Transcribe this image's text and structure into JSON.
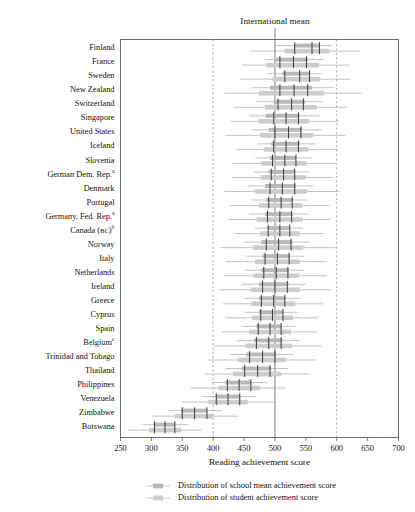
{
  "chart_data": {
    "type": "bar",
    "title": "",
    "top_annotation": "International mean",
    "xlabel": "Reading achievement score",
    "ylabel": "",
    "xlim": [
      250,
      700
    ],
    "xticks": [
      250,
      300,
      350,
      400,
      450,
      500,
      550,
      600,
      650,
      700
    ],
    "grid": false,
    "reference_lines": [
      {
        "value": 400,
        "style": "dashed"
      },
      {
        "value": 500,
        "style": "solid",
        "label": "International mean"
      },
      {
        "value": 600,
        "style": "dashed"
      }
    ],
    "legend_position": "bottom",
    "series": [
      {
        "name": "Distribution of school mean achievement score",
        "color": "#b9b9b9"
      },
      {
        "name": "Distribution of student achievement score",
        "color": "#cdcdcd"
      }
    ],
    "categories": [
      "Finland",
      "France",
      "Sweden",
      "New Zealand",
      "Switzerland",
      "Singapore",
      "United States",
      "Iceland",
      "Slovenia",
      "German Dem. Rep.",
      "Denmark",
      "Portugal",
      "Germany, Fed. Rep.",
      "Canada (BC)",
      "Norway",
      "Italy",
      "Netherlands",
      "Ireland",
      "Greece",
      "Cyprus",
      "Spain",
      "Belgium",
      "Trinidad and Tobago",
      "Thailand",
      "Philippines",
      "Venezuela",
      "Zimbabwe",
      "Botswana"
    ],
    "category_footnotes": {
      "German Dem. Rep.": "a",
      "Germany, Fed. Rep.": "a",
      "Canada (BC)": "b",
      "Belgium": "c"
    },
    "rows": [
      {
        "country": "Finland",
        "school": {
          "lo": 500,
          "q1": 532,
          "med": 560,
          "q3": 572,
          "hi": 592
        },
        "student": {
          "lo": 460,
          "q1": 516,
          "med": 560,
          "q3": 588,
          "hi": 638
        },
        "ticks": [
          532,
          560,
          572
        ]
      },
      {
        "country": "France",
        "school": {
          "lo": 483,
          "q1": 500,
          "med": 530,
          "q3": 553,
          "hi": 580
        },
        "student": {
          "lo": 447,
          "q1": 486,
          "med": 530,
          "q3": 571,
          "hi": 620
        },
        "ticks": [
          508,
          530,
          551
        ]
      },
      {
        "country": "Sweden",
        "school": {
          "lo": 488,
          "q1": 512,
          "med": 543,
          "q3": 556,
          "hi": 576
        },
        "student": {
          "lo": 443,
          "q1": 496,
          "med": 543,
          "q3": 573,
          "hi": 622
        },
        "ticks": [
          516,
          540,
          556
        ]
      },
      {
        "country": "New Zealand",
        "school": {
          "lo": 462,
          "q1": 492,
          "med": 531,
          "q3": 560,
          "hi": 596
        },
        "student": {
          "lo": 418,
          "q1": 474,
          "med": 531,
          "q3": 580,
          "hi": 640
        },
        "ticks": [
          508,
          531,
          553
        ]
      },
      {
        "country": "Switzerland",
        "school": {
          "lo": 470,
          "q1": 498,
          "med": 527,
          "q3": 549,
          "hi": 578
        },
        "student": {
          "lo": 434,
          "q1": 484,
          "med": 527,
          "q3": 568,
          "hi": 616
        },
        "ticks": [
          505,
          527,
          546
        ]
      },
      {
        "country": "Singapore",
        "school": {
          "lo": 458,
          "q1": 485,
          "med": 518,
          "q3": 540,
          "hi": 572
        },
        "student": {
          "lo": 428,
          "q1": 474,
          "med": 518,
          "q3": 555,
          "hi": 604
        },
        "ticks": [
          498,
          518,
          538
        ]
      },
      {
        "country": "United States",
        "school": {
          "lo": 462,
          "q1": 490,
          "med": 522,
          "q3": 544,
          "hi": 576
        },
        "student": {
          "lo": 420,
          "q1": 476,
          "med": 522,
          "q3": 562,
          "hi": 614
        },
        "ticks": [
          500,
          522,
          542
        ]
      },
      {
        "country": "Iceland",
        "school": {
          "lo": 472,
          "q1": 494,
          "med": 518,
          "q3": 540,
          "hi": 566
        },
        "student": {
          "lo": 438,
          "q1": 482,
          "med": 518,
          "q3": 554,
          "hi": 602
        },
        "ticks": [
          498,
          518,
          538
        ]
      },
      {
        "country": "Slovenia",
        "school": {
          "lo": 468,
          "q1": 492,
          "med": 516,
          "q3": 534,
          "hi": 560
        },
        "student": {
          "lo": 432,
          "q1": 478,
          "med": 516,
          "q3": 552,
          "hi": 598
        },
        "ticks": [
          496,
          516,
          534
        ]
      },
      {
        "country": "German Dem. Rep.",
        "school": {
          "lo": 466,
          "q1": 490,
          "med": 514,
          "q3": 532,
          "hi": 556
        },
        "student": {
          "lo": 430,
          "q1": 477,
          "med": 514,
          "q3": 550,
          "hi": 594
        },
        "ticks": [
          494,
          514,
          532
        ]
      },
      {
        "country": "Denmark",
        "school": {
          "lo": 456,
          "q1": 484,
          "med": 512,
          "q3": 534,
          "hi": 562
        },
        "student": {
          "lo": 418,
          "q1": 468,
          "med": 512,
          "q3": 552,
          "hi": 604
        },
        "ticks": [
          492,
          512,
          532
        ]
      },
      {
        "country": "Portugal",
        "school": {
          "lo": 462,
          "q1": 486,
          "med": 510,
          "q3": 528,
          "hi": 552
        },
        "student": {
          "lo": 428,
          "q1": 474,
          "med": 510,
          "q3": 544,
          "hi": 588
        },
        "ticks": [
          490,
          510,
          528
        ]
      },
      {
        "country": "Germany, Fed. Rep.",
        "school": {
          "lo": 458,
          "q1": 484,
          "med": 508,
          "q3": 528,
          "hi": 554
        },
        "student": {
          "lo": 424,
          "q1": 470,
          "med": 508,
          "q3": 545,
          "hi": 590
        },
        "ticks": [
          488,
          508,
          527
        ]
      },
      {
        "country": "Canada (BC)",
        "school": {
          "lo": 468,
          "q1": 488,
          "med": 508,
          "q3": 524,
          "hi": 546
        },
        "student": {
          "lo": 434,
          "q1": 476,
          "med": 508,
          "q3": 540,
          "hi": 580
        },
        "ticks": [
          489,
          508,
          524
        ]
      },
      {
        "country": "Norway",
        "school": {
          "lo": 450,
          "q1": 478,
          "med": 506,
          "q3": 528,
          "hi": 556
        },
        "student": {
          "lo": 412,
          "q1": 464,
          "med": 506,
          "q3": 546,
          "hi": 598
        },
        "ticks": [
          486,
          506,
          526
        ]
      },
      {
        "country": "Italy",
        "school": {
          "lo": 454,
          "q1": 480,
          "med": 504,
          "q3": 524,
          "hi": 548
        },
        "student": {
          "lo": 420,
          "q1": 468,
          "med": 504,
          "q3": 540,
          "hi": 584
        },
        "ticks": [
          484,
          504,
          523
        ]
      },
      {
        "country": "Netherlands",
        "school": {
          "lo": 452,
          "q1": 478,
          "med": 502,
          "q3": 522,
          "hi": 548
        },
        "student": {
          "lo": 418,
          "q1": 465,
          "med": 502,
          "q3": 539,
          "hi": 584
        },
        "ticks": [
          482,
          502,
          521
        ]
      },
      {
        "country": "Ireland",
        "school": {
          "lo": 446,
          "q1": 474,
          "med": 500,
          "q3": 522,
          "hi": 550
        },
        "student": {
          "lo": 410,
          "q1": 460,
          "med": 500,
          "q3": 540,
          "hi": 590
        },
        "ticks": [
          480,
          500,
          520
        ]
      },
      {
        "country": "Greece",
        "school": {
          "lo": 450,
          "q1": 474,
          "med": 498,
          "q3": 517,
          "hi": 542
        },
        "student": {
          "lo": 416,
          "q1": 462,
          "med": 498,
          "q3": 533,
          "hi": 578
        },
        "ticks": [
          478,
          498,
          516
        ]
      },
      {
        "country": "Cyprus",
        "school": {
          "lo": 452,
          "q1": 474,
          "med": 496,
          "q3": 513,
          "hi": 536
        },
        "student": {
          "lo": 420,
          "q1": 463,
          "med": 496,
          "q3": 529,
          "hi": 570
        },
        "ticks": [
          477,
          496,
          513
        ]
      },
      {
        "country": "Spain",
        "school": {
          "lo": 448,
          "q1": 470,
          "med": 492,
          "q3": 510,
          "hi": 534
        },
        "student": {
          "lo": 414,
          "q1": 458,
          "med": 492,
          "q3": 526,
          "hi": 568
        },
        "ticks": [
          473,
          492,
          510
        ]
      },
      {
        "country": "Belgium",
        "school": {
          "lo": 438,
          "q1": 466,
          "med": 490,
          "q3": 512,
          "hi": 540
        },
        "student": {
          "lo": 402,
          "q1": 452,
          "med": 490,
          "q3": 528,
          "hi": 576
        },
        "ticks": [
          470,
          490,
          510
        ]
      },
      {
        "country": "Trinidad and Tobago",
        "school": {
          "lo": 428,
          "q1": 454,
          "med": 480,
          "q3": 502,
          "hi": 530
        },
        "student": {
          "lo": 392,
          "q1": 440,
          "med": 480,
          "q3": 518,
          "hi": 566
        },
        "ticks": [
          459,
          480,
          500
        ]
      },
      {
        "country": "Thailand",
        "school": {
          "lo": 420,
          "q1": 446,
          "med": 472,
          "q3": 494,
          "hi": 522
        },
        "student": {
          "lo": 386,
          "q1": 432,
          "med": 472,
          "q3": 510,
          "hi": 556
        },
        "ticks": [
          451,
          472,
          492
        ]
      },
      {
        "country": "Philippines",
        "school": {
          "lo": 398,
          "q1": 420,
          "med": 442,
          "q3": 462,
          "hi": 488
        },
        "student": {
          "lo": 364,
          "q1": 408,
          "med": 442,
          "q3": 476,
          "hi": 518
        },
        "ticks": [
          423,
          442,
          461
        ]
      },
      {
        "country": "Venezuela",
        "school": {
          "lo": 382,
          "q1": 404,
          "med": 424,
          "q3": 444,
          "hi": 470
        },
        "student": {
          "lo": 350,
          "q1": 392,
          "med": 424,
          "q3": 456,
          "hi": 498
        },
        "ticks": [
          405,
          424,
          443
        ]
      },
      {
        "country": "Zimbabwe",
        "school": {
          "lo": 328,
          "q1": 348,
          "med": 370,
          "q3": 390,
          "hi": 414
        },
        "student": {
          "lo": 300,
          "q1": 338,
          "med": 370,
          "q3": 400,
          "hi": 440
        },
        "ticks": [
          350,
          370,
          390
        ]
      },
      {
        "country": "Botswana",
        "school": {
          "lo": 286,
          "q1": 304,
          "med": 322,
          "q3": 338,
          "hi": 360
        },
        "student": {
          "lo": 262,
          "q1": 296,
          "med": 322,
          "q3": 348,
          "hi": 382
        },
        "ticks": [
          305,
          322,
          338
        ]
      }
    ]
  }
}
